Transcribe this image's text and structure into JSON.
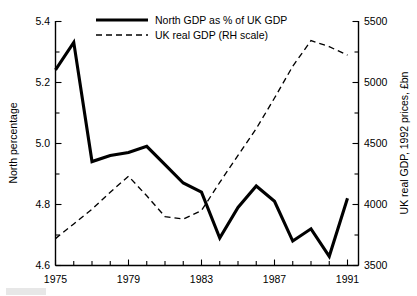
{
  "chart_data": {
    "type": "line",
    "title": "",
    "subtitle": "",
    "xlabel": "",
    "ylabel": "North percentage",
    "y2label": "UK real GDP, 1992 prices, £bn",
    "grid": false,
    "legend_position": "top-center",
    "xlim": [
      1975,
      1991.6
    ],
    "ylim": [
      4.6,
      5.4
    ],
    "y2lim": [
      3500,
      5500
    ],
    "x": [
      1975,
      1976,
      1977,
      1978,
      1979,
      1980,
      1981,
      1982,
      1983,
      1984,
      1985,
      1986,
      1987,
      1988,
      1989,
      1990,
      1991
    ],
    "xticks": [
      1975,
      1979,
      1983,
      1987,
      1991
    ],
    "xtick_labels": [
      "1975",
      "1979",
      "1983",
      "1987",
      "1991"
    ],
    "xminor_ticks": [
      1976,
      1977,
      1978,
      1980,
      1981,
      1982,
      1984,
      1985,
      1986,
      1988,
      1989,
      1990
    ],
    "yticks": [
      4.6,
      4.8,
      5.0,
      5.2,
      5.4
    ],
    "ytick_labels": [
      "4.6",
      "4.8",
      "5.0",
      "5.2",
      "5.4"
    ],
    "yminor_ticks": [
      4.7,
      4.9,
      5.1,
      5.3
    ],
    "y2ticks": [
      3500,
      4000,
      4500,
      5000,
      5500
    ],
    "y2tick_labels": [
      "3500",
      "4000",
      "4500",
      "5000",
      "5500"
    ],
    "y2minor_ticks": [
      3750,
      4250,
      4750,
      5250
    ],
    "series": [
      {
        "name": "North GDP as % of UK GDP",
        "axis": "left",
        "style": "solid",
        "values": [
          5.24,
          5.33,
          4.94,
          4.96,
          4.97,
          4.99,
          4.93,
          4.87,
          4.84,
          4.69,
          4.79,
          4.86,
          4.81,
          4.68,
          4.72,
          4.63,
          4.82
        ]
      },
      {
        "name": "UK real GDP (RH scale)",
        "axis": "right",
        "style": "dashed",
        "values": [
          3720,
          3840,
          3960,
          4100,
          4230,
          4070,
          3900,
          3880,
          3950,
          4180,
          4400,
          4620,
          4870,
          5130,
          5340,
          5290,
          5220
        ]
      }
    ],
    "legend": [
      {
        "label": "North GDP as % of UK GDP",
        "style": "solid"
      },
      {
        "label": "UK real GDP (RH scale)",
        "style": "dashed"
      }
    ]
  }
}
